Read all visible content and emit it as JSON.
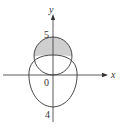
{
  "figure": {
    "type": "polar-region-diagram",
    "axes": {
      "x_label": "x",
      "y_label": "y",
      "origin_label": "0"
    },
    "tick_labels": {
      "top": "5",
      "bottom": "4"
    },
    "curves": [
      {
        "name": "circle",
        "description": "upper circle through origin reaching y=5"
      },
      {
        "name": "cardioid-like",
        "description": "lower closed curve reaching y=-4"
      }
    ],
    "shaded_region": {
      "description": "part of upper circle outside the lower curve",
      "fill_color": "#cfcfcf"
    },
    "colors": {
      "stroke": "#333333",
      "shade": "#cfcfcf"
    }
  }
}
